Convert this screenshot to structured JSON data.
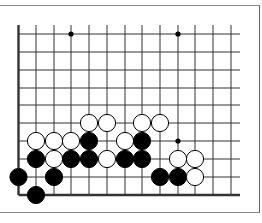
{
  "diagram": {
    "type": "go-board-corner",
    "grid": {
      "columns_x": [
        18.5,
        36,
        54,
        71,
        89,
        107,
        125,
        142,
        160,
        178,
        195,
        213,
        231
      ],
      "rows_y": [
        34,
        52,
        70,
        88,
        105,
        123,
        141,
        159,
        177,
        195
      ],
      "top_extent": 25,
      "right_extent": 240,
      "left_edge_thick": true,
      "bottom_edge_thick": true,
      "line_color": "#333333"
    },
    "hoshi": [
      {
        "x": 71,
        "y": 34
      },
      {
        "x": 178,
        "y": 34
      },
      {
        "x": 178,
        "y": 141
      }
    ],
    "stones": [
      {
        "color": "white",
        "x": 89,
        "y": 123
      },
      {
        "color": "white",
        "x": 107,
        "y": 123
      },
      {
        "color": "white",
        "x": 142,
        "y": 123
      },
      {
        "color": "white",
        "x": 160,
        "y": 123
      },
      {
        "color": "white",
        "x": 36,
        "y": 141
      },
      {
        "color": "white",
        "x": 54,
        "y": 141
      },
      {
        "color": "white",
        "x": 71,
        "y": 141
      },
      {
        "color": "black",
        "x": 89,
        "y": 141
      },
      {
        "color": "white",
        "x": 125,
        "y": 141
      },
      {
        "color": "black",
        "x": 142,
        "y": 141
      },
      {
        "color": "black",
        "x": 36,
        "y": 159
      },
      {
        "color": "white",
        "x": 54,
        "y": 159
      },
      {
        "color": "black",
        "x": 71,
        "y": 159
      },
      {
        "color": "black",
        "x": 89,
        "y": 159
      },
      {
        "color": "white",
        "x": 107,
        "y": 159
      },
      {
        "color": "black",
        "x": 125,
        "y": 159
      },
      {
        "color": "black",
        "x": 142,
        "y": 159
      },
      {
        "color": "white",
        "x": 178,
        "y": 159
      },
      {
        "color": "white",
        "x": 195,
        "y": 159
      },
      {
        "color": "black",
        "x": 18.5,
        "y": 177
      },
      {
        "color": "black",
        "x": 54,
        "y": 177
      },
      {
        "color": "black",
        "x": 160,
        "y": 177
      },
      {
        "color": "black",
        "x": 178,
        "y": 177
      },
      {
        "color": "white",
        "x": 195,
        "y": 177
      },
      {
        "color": "black",
        "x": 36,
        "y": 195
      }
    ],
    "stone_radius": 8.6
  }
}
